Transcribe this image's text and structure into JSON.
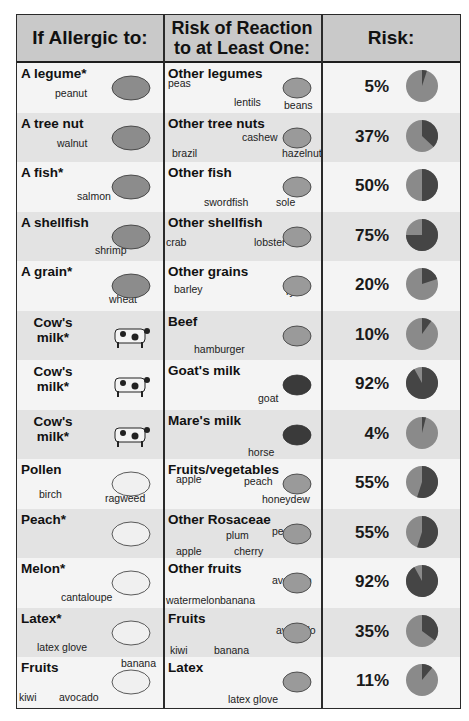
{
  "header": {
    "col1": "If Allergic to:",
    "col2": "Risk of Reaction to at Least One:",
    "col3": "Risk:"
  },
  "colors": {
    "low": "#8a8a8a",
    "high": "#454545",
    "header_bg": "#c9c9c9"
  },
  "rows": [
    {
      "allergen": "A legume*",
      "allergen_items": [
        "peanut"
      ],
      "related": "Other legumes",
      "related_items": [
        "peas",
        "lentils",
        "beans"
      ],
      "risk_label": "5%"
    },
    {
      "allergen": "A tree nut",
      "allergen_items": [
        "walnut"
      ],
      "related": "Other tree nuts",
      "related_items": [
        "brazil",
        "cashew",
        "hazelnut"
      ],
      "risk_label": "37%"
    },
    {
      "allergen": "A fish*",
      "allergen_items": [
        "salmon"
      ],
      "related": "Other fish",
      "related_items": [
        "swordfish",
        "sole"
      ],
      "risk_label": "50%"
    },
    {
      "allergen": "A shellfish",
      "allergen_items": [
        "shrimp"
      ],
      "related": "Other shellfish",
      "related_items": [
        "crab",
        "lobster"
      ],
      "risk_label": "75%"
    },
    {
      "allergen": "A grain*",
      "allergen_items": [
        "wheat"
      ],
      "related": "Other grains",
      "related_items": [
        "barley",
        "rye"
      ],
      "risk_label": "20%"
    },
    {
      "allergen": "Cow's milk*",
      "allergen_items": [],
      "related": "Beef",
      "related_items": [
        "hamburger"
      ],
      "risk_label": "10%"
    },
    {
      "allergen": "Cow's milk*",
      "allergen_items": [],
      "related": "Goat's milk",
      "related_items": [
        "goat"
      ],
      "risk_label": "92%"
    },
    {
      "allergen": "Cow's milk*",
      "allergen_items": [],
      "related": "Mare's milk",
      "related_items": [
        "horse"
      ],
      "risk_label": "4%"
    },
    {
      "allergen": "Pollen",
      "allergen_items": [
        "birch",
        "ragweed"
      ],
      "related": "Fruits/vegetables",
      "related_items": [
        "apple",
        "peach",
        "honeydew"
      ],
      "risk_label": "55%"
    },
    {
      "allergen": "Peach*",
      "allergen_items": [],
      "related": "Other Rosaceae",
      "related_items": [
        "apple",
        "plum",
        "cherry",
        "pear"
      ],
      "risk_label": "55%"
    },
    {
      "allergen": "Melon*",
      "allergen_items": [
        "cantaloupe"
      ],
      "related": "Other fruits",
      "related_items": [
        "watermelon",
        "banana",
        "avocado"
      ],
      "risk_label": "92%"
    },
    {
      "allergen": "Latex*",
      "allergen_items": [
        "latex glove"
      ],
      "related": "Fruits",
      "related_items": [
        "kiwi",
        "banana",
        "avocado"
      ],
      "risk_label": "35%"
    },
    {
      "allergen": "Fruits",
      "allergen_items": [
        "kiwi",
        "avocado",
        "banana"
      ],
      "related": "Latex",
      "related_items": [
        "latex glove"
      ],
      "risk_label": "11%"
    }
  ],
  "chart_data": {
    "type": "table",
    "title": "",
    "columns": [
      "If Allergic to:",
      "Risk of Reaction to at Least One:",
      "Risk:"
    ],
    "categories": [
      "A legume*",
      "A tree nut",
      "A fish*",
      "A shellfish",
      "A grain*",
      "Cow's milk* (Beef)",
      "Cow's milk* (Goat's milk)",
      "Cow's milk* (Mare's milk)",
      "Pollen",
      "Peach*",
      "Melon*",
      "Latex*",
      "Fruits"
    ],
    "related": [
      "Other legumes",
      "Other tree nuts",
      "Other fish",
      "Other shellfish",
      "Other grains",
      "Beef",
      "Goat's milk",
      "Mare's milk",
      "Fruits/vegetables",
      "Other Rosaceae",
      "Other fruits",
      "Fruits",
      "Latex"
    ],
    "values": [
      5,
      37,
      50,
      75,
      20,
      10,
      92,
      4,
      55,
      55,
      92,
      35,
      11
    ],
    "unit": "%",
    "mark": "pie per row (dark slice = risk %)"
  }
}
